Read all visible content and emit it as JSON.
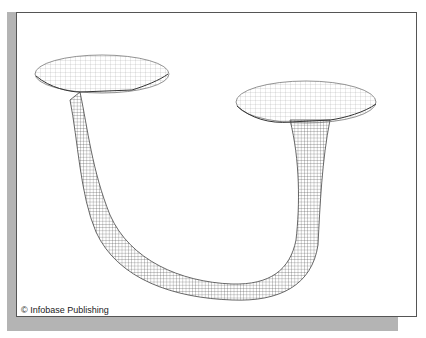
{
  "figure": {
    "credit": "© Infobase Publishing",
    "colors": {
      "mesh": "#333333",
      "shadow": "#b4b4b4",
      "border": "#555555",
      "background": "#ffffff"
    }
  }
}
